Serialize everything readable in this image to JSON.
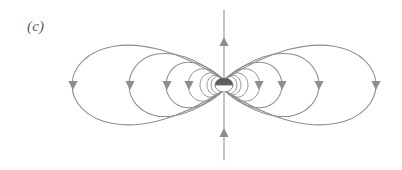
{
  "figure": {
    "label": "(c)",
    "caption_text": "(c)",
    "width": 402,
    "height": 170,
    "background_color": "#ffffff",
    "line_color": "#8e8e8e",
    "dipole_color": "#5d5d5d",
    "label_color": "#5a5a5a"
  },
  "chart_data": {
    "type": "line",
    "title": "(c)",
    "xlabel": "",
    "ylabel": "",
    "xlim": [
      0,
      402
    ],
    "ylim": [
      0,
      170
    ],
    "grid": false,
    "legend": "none",
    "center": {
      "x": 224,
      "y": 85
    },
    "dipole": {
      "name": "magnetic-dipole",
      "cx": 224,
      "cy": 85,
      "rx": 9,
      "ry": 7,
      "north_fill": "#5d5d5d",
      "south_fill": "#ffffff"
    },
    "axis": {
      "name": "dipole-axis",
      "x": 224,
      "y_top": 10,
      "y_bottom": 160,
      "direction": "up",
      "arrow_positions": [
        42,
        133
      ]
    },
    "loop_scales": [
      1.0,
      0.62,
      0.38,
      0.225,
      0.135,
      0.08,
      0.045
    ],
    "loops": [
      {
        "name": "outer-loop",
        "half_width": 152,
        "half_height": 62,
        "arrow_y": 85,
        "arrow_dir": "down",
        "side": "both"
      },
      {
        "name": "loop-2",
        "half_width": 95,
        "half_height": 48,
        "arrow_y": 85,
        "arrow_dir": "down",
        "side": "both"
      },
      {
        "name": "loop-3",
        "half_width": 58,
        "half_height": 33,
        "arrow_y": 85,
        "arrow_dir": "down",
        "side": "both"
      },
      {
        "name": "loop-4",
        "half_width": 36,
        "half_height": 22,
        "arrow_y": 85,
        "arrow_dir": "down",
        "side": "both"
      },
      {
        "name": "loop-5",
        "half_width": 24,
        "half_height": 15,
        "arrow_y": 85,
        "arrow_dir": "down",
        "side": "both"
      },
      {
        "name": "loop-6",
        "half_width": 17,
        "half_height": 11,
        "arrow_y": 85,
        "arrow_dir": "down",
        "side": "both"
      },
      {
        "name": "loop-7",
        "half_width": 13,
        "half_height": 8.5,
        "arrow_y": 85,
        "arrow_dir": "down",
        "side": "both"
      }
    ],
    "arrowheads": [
      {
        "name": "arrow-left-outer",
        "x": 73,
        "y": 85,
        "direction": "down"
      },
      {
        "name": "arrow-left-loop2",
        "x": 130,
        "y": 85,
        "direction": "down"
      },
      {
        "name": "arrow-left-loop3",
        "x": 167,
        "y": 85,
        "direction": "down"
      },
      {
        "name": "arrow-left-loop4",
        "x": 189,
        "y": 85,
        "direction": "down"
      },
      {
        "name": "arrow-right-loop4",
        "x": 259,
        "y": 85,
        "direction": "down"
      },
      {
        "name": "arrow-right-loop3",
        "x": 282,
        "y": 85,
        "direction": "down"
      },
      {
        "name": "arrow-right-loop2",
        "x": 319,
        "y": 85,
        "direction": "down"
      },
      {
        "name": "arrow-right-outer",
        "x": 376,
        "y": 85,
        "direction": "down"
      },
      {
        "name": "arrow-axis-upper",
        "x": 224,
        "y": 42,
        "direction": "up"
      },
      {
        "name": "arrow-axis-lower",
        "x": 224,
        "y": 133,
        "direction": "up"
      }
    ]
  }
}
